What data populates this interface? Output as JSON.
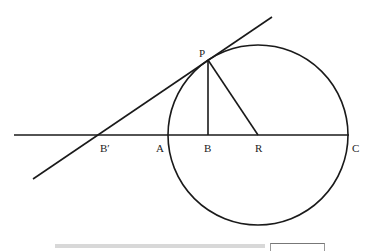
{
  "diagram": {
    "type": "geometry",
    "labels": {
      "P": "P",
      "B_prime": "B′",
      "A": "A",
      "B": "B",
      "R": "R",
      "C": "C"
    },
    "colors": {
      "stroke": "#1a1a1a",
      "background": "#ffffff"
    }
  }
}
